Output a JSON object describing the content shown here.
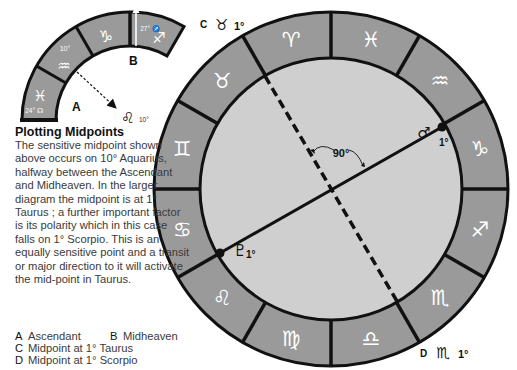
{
  "small_diagram": {
    "segments": [
      {
        "sign": "pisces",
        "glyph": "♓",
        "note": "24° ☊"
      },
      {
        "sign": "aquarius",
        "glyph": "♒",
        "note": "10°"
      },
      {
        "sign": "capricorn",
        "glyph": "♑",
        "note": ""
      },
      {
        "sign": "sagittarius",
        "glyph": "♐",
        "note": "27° ♐"
      }
    ],
    "label_a": "A",
    "label_b": "B",
    "arrow_target_glyph": "♌",
    "arrow_target_degree": "10°"
  },
  "caption": {
    "title": "Plotting Midpoints",
    "body": "The sensitive midpoint shown above occurs on 10° Aquarius, halfway between the Ascendant and Midheaven. In the larger diagram the midpoint is at 1° Taurus ; a further important factor is its polarity which in this case falls on 1° Scorpio. This is an equally sensitive point and a transit or major direction to it will activate the mid-point in Taurus."
  },
  "legend": [
    {
      "key": "A",
      "label": "Ascendant"
    },
    {
      "key": "B",
      "label": "Midheaven"
    },
    {
      "key": "C",
      "label": "Midpoint at 1° Taurus"
    },
    {
      "key": "D",
      "label": "Midpoint at 1° Scorpio"
    }
  ],
  "wheel": {
    "signs": [
      {
        "name": "sagittarius",
        "glyph": "♐"
      },
      {
        "name": "scorpio",
        "glyph": "♏"
      },
      {
        "name": "libra",
        "glyph": "♎"
      },
      {
        "name": "virgo",
        "glyph": "♍"
      },
      {
        "name": "leo",
        "glyph": "♌"
      },
      {
        "name": "cancer",
        "glyph": "♋"
      },
      {
        "name": "gemini",
        "glyph": "♊"
      },
      {
        "name": "taurus",
        "glyph": "♉"
      },
      {
        "name": "aries",
        "glyph": "♈"
      },
      {
        "name": "pisces",
        "glyph": "♓"
      },
      {
        "name": "aquarius",
        "glyph": "♒"
      },
      {
        "name": "capricorn",
        "glyph": "♑"
      }
    ],
    "label_c": {
      "key": "C",
      "glyph": "♉",
      "degree": "1°"
    },
    "label_d": {
      "key": "D",
      "glyph": "♏",
      "degree": "1°"
    },
    "mars": {
      "glyph": "♂",
      "degree": "1°"
    },
    "pluto": {
      "glyph": "♇",
      "degree": "1°"
    },
    "angle_label": "90°"
  },
  "colors": {
    "ring": "#9a9a9a",
    "inner": "#cfcfcf",
    "line": "#111111"
  }
}
